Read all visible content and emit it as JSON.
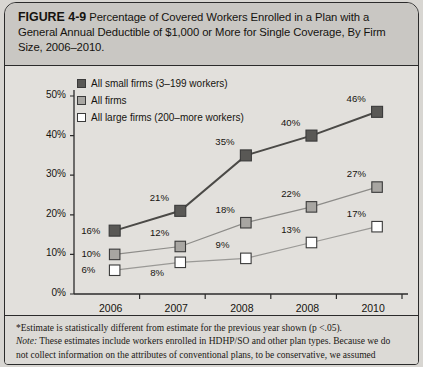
{
  "figure": {
    "number": "FIGURE 4-9",
    "title": "Percentage of Covered Workers Enrolled in a Plan with a General Annual Deductible of $1,000 or More for Single Coverage, By Firm Size, 2006–2010."
  },
  "footnotes": {
    "star_note": "*Estimate is statistically different from estimate for the previous year shown (p <.05).",
    "note_label": "Note:",
    "note_text": " These estimates include workers enrolled in HDHP/SO and other plan types. Because we do",
    "note_text_cut": "not collect information on the attributes of conventional plans, to be conservative, we assumed"
  },
  "colors": {
    "small_firms": "#595855",
    "all_firms": "#a8a6a2",
    "large_firms": "#ffffff",
    "marker_border": "#3a3a3a",
    "line_small": "#4b4a47",
    "line_all": "#8d8c89",
    "line_large": "#9a9996",
    "axis": "#2b2b2b",
    "plot_bg": "#e2e0dc",
    "header_bg": "#c9c7c3"
  },
  "chart_data": {
    "type": "line",
    "title": "Percentage of Covered Workers Enrolled in a Plan with a General Annual Deductible of $1,000 or More for Single Coverage, By Firm Size, 2006–2010.",
    "xlabel": "",
    "ylabel": "",
    "categories": [
      "2006",
      "2007",
      "2008",
      "2008",
      "2010"
    ],
    "ylim": [
      0,
      50
    ],
    "yticks": [
      "0%",
      "10%",
      "20%",
      "30%",
      "40%",
      "50%"
    ],
    "ytick_values": [
      0,
      10,
      20,
      30,
      40,
      50
    ],
    "grid": false,
    "legend_position": "top-left-inside",
    "series": [
      {
        "name": "All small firms (3–199 workers)",
        "marker": "filled-dark-square",
        "values": [
          16,
          21,
          35,
          40,
          46
        ],
        "labels": [
          "16%",
          "21%",
          "35%",
          "40%",
          "46%"
        ]
      },
      {
        "name": "All firms",
        "marker": "filled-gray-square",
        "values": [
          10,
          12,
          18,
          22,
          27
        ],
        "labels": [
          "10%",
          "12%",
          "18%",
          "22%",
          "27%"
        ]
      },
      {
        "name": "All large firms (200–more workers)",
        "marker": "open-white-square",
        "values": [
          6,
          8,
          9,
          13,
          17
        ],
        "labels": [
          "6%",
          "8%",
          "9%",
          "13%",
          "17%"
        ]
      }
    ]
  }
}
